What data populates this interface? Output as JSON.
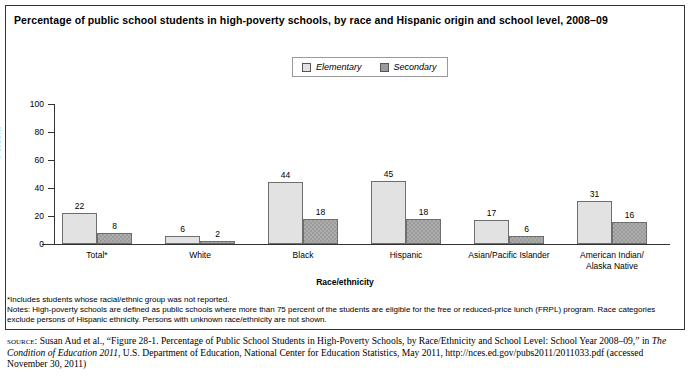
{
  "chart_data": {
    "type": "bar",
    "title": "Percentage of public school students in high-poverty schools, by race and Hispanic origin and school level, 2008–09",
    "xlabel": "Race/ethnicity",
    "ylabel": "Percent",
    "ylim": [
      0,
      100
    ],
    "yticks": [
      "0",
      "20",
      "40",
      "60",
      "80",
      "100"
    ],
    "grid": false,
    "legend_position": "top-center",
    "categories": [
      "Total*",
      "White",
      "Black",
      "Hispanic",
      "Asian/Pacific Islander",
      "American Indian/\nAlaska Native"
    ],
    "series": [
      {
        "name": "Elementary",
        "color": "#e2e2e2",
        "values": [
          22,
          6,
          44,
          45,
          17,
          31
        ]
      },
      {
        "name": "Secondary",
        "color": "#9b9b9b",
        "values": [
          8,
          2,
          18,
          18,
          6,
          16
        ]
      }
    ]
  },
  "notes": {
    "footnote": "*Includes students whose racial/ethnic group was not reported.",
    "note_line": "Notes: High-poverty schools are defined as public schools where more than 75 percent of the students are eligible for the free or reduced-price lunch (FRPL) program. Race categories exclude persons of Hispanic ethnicity. Persons with unknown race/ethnicity are not shown."
  },
  "source": {
    "label": "source:",
    "part1": " Susan Aud et al., “Figure 28-1. Percentage of Public School Students in High-Poverty Schools, by Race/Ethnicity and School Level: School Year 2008–09,” in ",
    "italic1": "The Condition of Education 2011",
    "part2": ", U.S. Department of Education, National Center for Education Statistics, May 2011, http://nces.ed.gov/pubs2011/2011033.pdf (accessed November 30, 2011)"
  }
}
